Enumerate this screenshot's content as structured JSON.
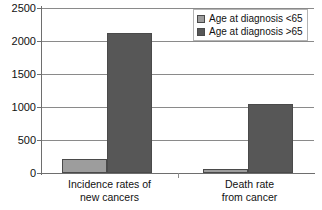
{
  "chart_data": {
    "type": "bar",
    "title": "",
    "xlabel": "",
    "ylabel": "",
    "categories": [
      "Incidence rates of new cancers",
      "Death rate from cancer"
    ],
    "category_lines": [
      [
        "Incidence rates of",
        "new cancers"
      ],
      [
        "Death rate",
        "from cancer"
      ]
    ],
    "series": [
      {
        "name": "Age at diagnosis <65",
        "color": "#9d9d9d",
        "values": [
          210,
          60
        ]
      },
      {
        "name": "Age at diagnosis >65",
        "color": "#575757",
        "values": [
          2120,
          1050
        ]
      }
    ],
    "ylim": [
      0,
      2500
    ],
    "yticks": [
      0,
      500,
      1000,
      1500,
      2000,
      2500
    ],
    "ytick_labels": [
      "0",
      "500",
      "1000",
      "1500",
      "2000",
      "2500"
    ],
    "grid": true,
    "legend_position": "top-right"
  },
  "legend": {
    "items": [
      {
        "label": "Age at diagnosis <65",
        "swatch": "light"
      },
      {
        "label": "Age at diagnosis >65",
        "swatch": "dark"
      }
    ]
  },
  "colors": {
    "series_light": "#9d9d9d",
    "series_dark": "#575757",
    "gridline": "#8a8a8a",
    "axis": "#6e6e6e",
    "text": "#111111",
    "background": "#ffffff"
  }
}
